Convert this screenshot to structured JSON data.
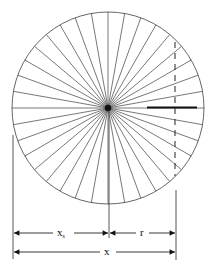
{
  "diagram": {
    "type": "spoked-disk-dimension-drawing",
    "colors": {
      "stroke": "#555555",
      "dark": "#111111",
      "background": "#ffffff"
    },
    "circle": {
      "cx": 108,
      "cy": 108,
      "r": 96,
      "spoke_count": 36
    },
    "labels": {
      "xs": "x",
      "xs_sub": "s",
      "r": "r",
      "x": "x"
    }
  }
}
